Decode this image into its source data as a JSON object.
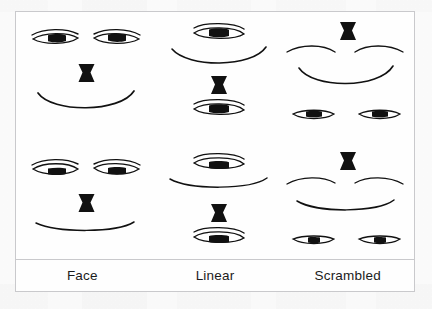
{
  "figure": {
    "type": "stimulus-diagram",
    "background_color": "#fdfdfd",
    "frame_color": "#c9c9cc",
    "ink_color": "#111111",
    "columns": [
      {
        "key": "face",
        "label": "Face"
      },
      {
        "key": "linear",
        "label": "Linear"
      },
      {
        "key": "scrambled",
        "label": "Scrambled"
      }
    ],
    "rows": [
      {
        "key": "smiling",
        "expression": "smiling"
      },
      {
        "key": "neutral",
        "expression": "neutral"
      }
    ],
    "cells": [
      {
        "row": "smiling",
        "column": "face",
        "arrangement": "veridical face configuration",
        "features": [
          "left-eye",
          "right-eye",
          "nose",
          "mouth"
        ],
        "mouth_shape": "upturned curve",
        "pupil_position": "centered"
      },
      {
        "row": "smiling",
        "column": "linear",
        "arrangement": "features stacked in a vertical column",
        "features": [
          "top-eye",
          "mouth",
          "nose",
          "bottom-eye"
        ],
        "mouth_shape": "upturned curve",
        "pupil_position": "centered"
      },
      {
        "row": "smiling",
        "column": "scrambled",
        "arrangement": "feature positions randomly rearranged",
        "features": [
          "nose-top",
          "left-brow",
          "right-brow",
          "mouth",
          "left-eye-bottom",
          "right-eye-bottom"
        ],
        "mouth_shape": "upturned curve",
        "pupil_position": "centered"
      },
      {
        "row": "neutral",
        "column": "face",
        "arrangement": "veridical face configuration",
        "features": [
          "left-eye",
          "right-eye",
          "nose",
          "mouth"
        ],
        "mouth_shape": "nearly flat curve",
        "pupil_position": "lowered"
      },
      {
        "row": "neutral",
        "column": "linear",
        "arrangement": "features stacked in a vertical column",
        "features": [
          "top-eye",
          "mouth",
          "nose",
          "bottom-eye"
        ],
        "mouth_shape": "nearly flat curve",
        "pupil_position": "lowered"
      },
      {
        "row": "neutral",
        "column": "scrambled",
        "arrangement": "feature positions randomly rearranged",
        "features": [
          "nose-top",
          "left-brow",
          "right-brow",
          "mouth",
          "left-eye-bottom",
          "right-eye-bottom"
        ],
        "mouth_shape": "nearly flat curve",
        "pupil_position": "lowered"
      }
    ]
  }
}
